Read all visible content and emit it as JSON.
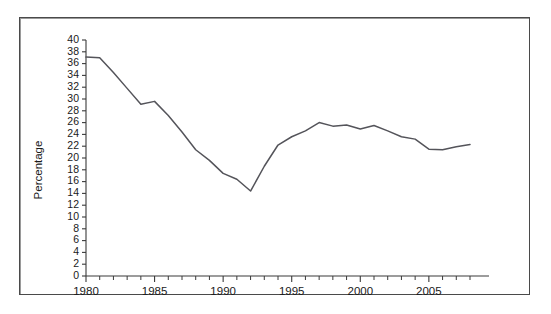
{
  "chart_data": {
    "type": "line",
    "title": "",
    "xlabel": "",
    "ylabel": "Percentage",
    "xlim": [
      1980,
      2008
    ],
    "ylim": [
      0,
      40
    ],
    "ytick_step": 2,
    "xtick_step": 5,
    "x_minor_tick_step": 1,
    "grid": false,
    "legend": null,
    "line_color": "#54545a",
    "axis_color": "#3a3a3a",
    "background_color": "#ffffff",
    "border_color": "#4a4a4a",
    "ytick_labels": [
      "0",
      "2",
      "4",
      "6",
      "8",
      "10",
      "12",
      "14",
      "16",
      "18",
      "20",
      "22",
      "24",
      "26",
      "28",
      "30",
      "32",
      "34",
      "36",
      "38",
      "40"
    ],
    "xtick_labels": [
      "1980",
      "1985",
      "1990",
      "1995",
      "2000",
      "2005"
    ],
    "x": [
      1980,
      1981,
      1982,
      1983,
      1984,
      1985,
      1986,
      1987,
      1988,
      1989,
      1990,
      1991,
      1992,
      1993,
      1994,
      1995,
      1996,
      1997,
      1998,
      1999,
      2000,
      2001,
      2002,
      2003,
      2004,
      2005,
      2006,
      2007,
      2008
    ],
    "values": [
      37.1,
      37.0,
      34.5,
      31.8,
      29.1,
      29.6,
      27.2,
      24.4,
      21.4,
      19.6,
      17.4,
      16.4,
      14.4,
      18.6,
      22.2,
      23.6,
      24.6,
      26.0,
      25.4,
      25.6,
      24.9,
      25.5,
      24.6,
      23.6,
      23.2,
      21.5,
      21.4,
      21.9,
      22.3
    ]
  }
}
